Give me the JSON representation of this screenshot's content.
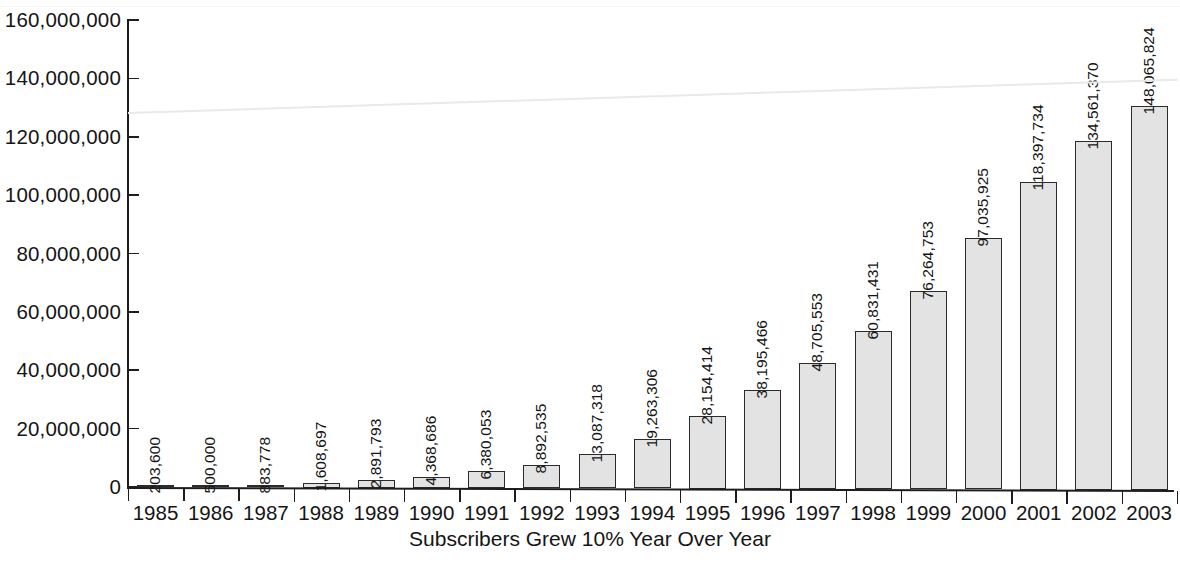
{
  "chart_data": {
    "type": "bar",
    "title": "",
    "subtitle": "",
    "xlabel": "Subscribers Grew 10% Year Over Year",
    "ylabel": "",
    "categories": [
      "1985",
      "1986",
      "1987",
      "1988",
      "1989",
      "1990",
      "1991",
      "1992",
      "1993",
      "1994",
      "1995",
      "1996",
      "1997",
      "1998",
      "1999",
      "2000",
      "2001",
      "2002",
      "2003"
    ],
    "values": [
      203600,
      500000,
      883778,
      1608697,
      2891793,
      4368686,
      6380053,
      8892535,
      13087318,
      19263306,
      28154414,
      38195466,
      48705553,
      60831431,
      76264753,
      97035925,
      118397734,
      134561370,
      148065824
    ],
    "value_labels": [
      "203,600",
      "500,000",
      "883,778",
      "1,608,697",
      "2,891,793",
      "4,368,686",
      "6,380,053",
      "8,892,535",
      "13,087,318",
      "19,263,306",
      "28,154,414",
      "38,195,466",
      "48,705,553",
      "60,831,431",
      "76,264,753",
      "97,035,925",
      "118,397,734",
      "134,561,370",
      "148,065,824"
    ],
    "ylim": [
      0,
      160000000
    ],
    "y_ticks": [
      0,
      20000000,
      40000000,
      60000000,
      80000000,
      100000000,
      120000000,
      140000000,
      160000000
    ],
    "y_tick_labels": [
      "0",
      "20,000,000",
      "40,000,000",
      "60,000,000",
      "80,000,000",
      "100,000,000",
      "120,000,000",
      "140,000,000",
      "160,000,000"
    ],
    "grid": false,
    "legend": false,
    "legend_position": "none",
    "bar_fill_color": "#e3e3e3",
    "bar_border_color": "#2b2b2b",
    "axis_color": "#1d1d1d",
    "background_color": "#ffffff",
    "value_label_rotation": -90,
    "series": [
      {
        "name": "Subscribers",
        "values": [
          203600,
          500000,
          883778,
          1608697,
          2891793,
          4368686,
          6380053,
          8892535,
          13087318,
          19263306,
          28154414,
          38195466,
          48705553,
          60831431,
          76264753,
          97035925,
          118397734,
          134561370,
          148065824
        ]
      }
    ]
  },
  "caption": {
    "text": "Subscribers Grew 10% Year Over Year"
  }
}
